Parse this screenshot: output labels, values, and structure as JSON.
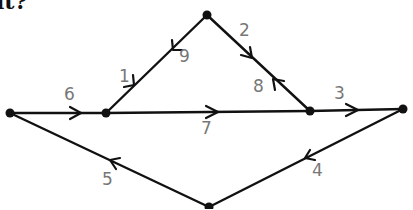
{
  "caption": "it?",
  "graph": {
    "type": "directed-graph",
    "colors": {
      "edge": "#111111",
      "node": "#111111",
      "label": "#777777"
    },
    "nodes": [
      {
        "id": "top",
        "x": 207,
        "y": 15
      },
      {
        "id": "left",
        "x": 10,
        "y": 113
      },
      {
        "id": "mid_left",
        "x": 106,
        "y": 113
      },
      {
        "id": "mid_right",
        "x": 310,
        "y": 111
      },
      {
        "id": "right",
        "x": 403,
        "y": 109
      },
      {
        "id": "bottom",
        "x": 209,
        "y": 207
      }
    ],
    "edges": [
      {
        "label": "1",
        "from": "mid_left",
        "to": "top"
      },
      {
        "label": "2",
        "from": "top",
        "to": "mid_right"
      },
      {
        "label": "3",
        "from": "mid_right",
        "to": "right"
      },
      {
        "label": "4",
        "from": "right",
        "to": "bottom"
      },
      {
        "label": "5",
        "from": "bottom",
        "to": "left"
      },
      {
        "label": "6",
        "from": "left",
        "to": "mid_left"
      },
      {
        "label": "7",
        "from": "mid_left",
        "to": "mid_right"
      },
      {
        "label": "8",
        "from": "mid_right",
        "to": "top"
      },
      {
        "label": "9",
        "from": "top",
        "to": "mid_left"
      }
    ]
  },
  "labels": {
    "e1": "1",
    "e2": "2",
    "e3": "3",
    "e4": "4",
    "e5": "5",
    "e6": "6",
    "e7": "7",
    "e8": "8",
    "e9": "9"
  }
}
